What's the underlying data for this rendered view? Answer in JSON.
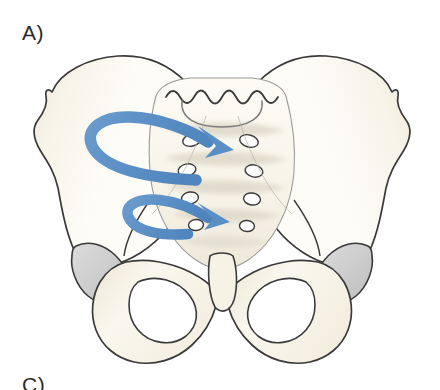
{
  "figure": {
    "background_color": "#ffffff",
    "width": 440,
    "height": 390
  },
  "labels": {
    "panel_a": "A)",
    "panel_c": "C)"
  },
  "palette": {
    "arrow_blue": "#5f93c7",
    "arrow_blue_dark": "#4c82ba",
    "bone_fill": "#fdfbf5",
    "bone_fill_warm": "#f4efe2",
    "bone_shadow": "#e6dfcd",
    "bone_shadow_deep": "#d9d0ba",
    "cartilage_gray": "#d2d2d2",
    "cartilage_gray_dark": "#c0c0c0",
    "outline": "#3a3a3a",
    "outline_light": "#8e8e8e",
    "sacrum_ridge": "#e2ded3"
  },
  "anatomy": {
    "view": "anterior",
    "structures": [
      {
        "name": "left-ilium",
        "label": "Left ilium",
        "fill": "#fdfbf5"
      },
      {
        "name": "right-ilium",
        "label": "Right ilium",
        "fill": "#fdfbf5"
      },
      {
        "name": "sacrum",
        "label": "Sacrum",
        "fill": "#fdfbf5"
      },
      {
        "name": "l5-vertebra",
        "label": "L5 vertebra",
        "fill": "#fdfbf5"
      },
      {
        "name": "pubic-symphysis",
        "label": "Pubic symphysis",
        "fill": "#fdfbf5"
      },
      {
        "name": "left-acetabulum",
        "label": "Left acetabulum",
        "fill": "#d2d2d2"
      },
      {
        "name": "right-acetabulum",
        "label": "Right acetabulum",
        "fill": "#d2d2d2"
      },
      {
        "name": "left-obturator-foramen",
        "label": "Left obturator foramen",
        "fill": "#fdfbf5"
      },
      {
        "name": "right-obturator-foramen",
        "label": "Right obturator foramen",
        "fill": "#fdfbf5"
      }
    ],
    "sacral_foramina_pairs": 4,
    "sacral_transverse_ridges": 4
  },
  "annotations": {
    "arrows": [
      {
        "name": "upper-rotation-arrow",
        "description": "Large looping arrow curving leftward around the left ilium then sweeping right across the sacrum",
        "color": "#5f93c7",
        "direction": "counter-clockwise-loop-to-right",
        "stroke_width": 11
      },
      {
        "name": "lower-rotation-arrow",
        "description": "Smaller looping arrow curving leftward below then sweeping right across the lower sacrum",
        "color": "#5f93c7",
        "direction": "counter-clockwise-loop-to-right",
        "stroke_width": 10
      }
    ]
  }
}
